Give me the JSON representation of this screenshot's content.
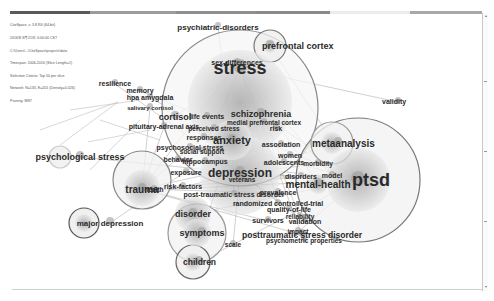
{
  "header": {
    "info_lines": [
      "CiteSpace, v. 3.8.R6 (64-bit)",
      "2016年3月21日 0:00:00 CST",
      "C:\\Users\\...\\CiteSpace\\projects\\data",
      "Timespan: 2006-2016 (Slice Length=1)",
      "Selection Criteria: Top 50 per slice",
      "Network: N=133, E=201 (Density=0.026)",
      "Pruning: MST"
    ],
    "timeline_colors": [
      "#5a5a5a",
      "#7a7a7a",
      "#9c9c9c",
      "#8e8e8e",
      "#8a8a8a",
      "#ececec",
      "#a8a8a8"
    ]
  },
  "network": {
    "title": "Keyword co-occurrence network",
    "nodes": [
      {
        "label": "stress",
        "size": "xl"
      },
      {
        "label": "ptsd",
        "size": "xl"
      },
      {
        "label": "depression",
        "size": "l"
      },
      {
        "label": "anxiety",
        "size": "m"
      },
      {
        "label": "trauma",
        "size": "m"
      },
      {
        "label": "mental-health",
        "size": "m"
      },
      {
        "label": "metaanalysis",
        "size": "m"
      },
      {
        "label": "prefrontal cortex",
        "size": "m"
      },
      {
        "label": "psychiatric-disorders",
        "size": "s"
      },
      {
        "label": "sex-differences",
        "size": "s"
      },
      {
        "label": "validity",
        "size": "s"
      },
      {
        "label": "resilience",
        "size": "s"
      },
      {
        "label": "memory",
        "size": "s"
      },
      {
        "label": "hpa amygdala",
        "size": "s"
      },
      {
        "label": "salivary cortisol",
        "size": "s"
      },
      {
        "label": "cortisol",
        "size": "m"
      },
      {
        "label": "life events",
        "size": "s"
      },
      {
        "label": "schizophrenia",
        "size": "m"
      },
      {
        "label": "medial prefrontal cortex",
        "size": "s"
      },
      {
        "label": "pituitary-adrenal axis",
        "size": "s"
      },
      {
        "label": "perceived stress",
        "size": "s"
      },
      {
        "label": "risk",
        "size": "s"
      },
      {
        "label": "responses",
        "size": "s"
      },
      {
        "label": "association",
        "size": "s"
      },
      {
        "label": "psychosocial stress",
        "size": "s"
      },
      {
        "label": "social support",
        "size": "s"
      },
      {
        "label": "psychological stress",
        "size": "m"
      },
      {
        "label": "behavior",
        "size": "s"
      },
      {
        "label": "hippocampus",
        "size": "s"
      },
      {
        "label": "women",
        "size": "s"
      },
      {
        "label": "adolescents",
        "size": "s"
      },
      {
        "label": "morbidity",
        "size": "s"
      },
      {
        "label": "exposure",
        "size": "s"
      },
      {
        "label": "veterans",
        "size": "s"
      },
      {
        "label": "disorders",
        "size": "s"
      },
      {
        "label": "model",
        "size": "s"
      },
      {
        "label": "risk-factors",
        "size": "s"
      },
      {
        "label": "health",
        "size": "s"
      },
      {
        "label": "post-traumatic stress disorder",
        "size": "s"
      },
      {
        "label": "prevalence",
        "size": "s"
      },
      {
        "label": "randomized controlled-trial",
        "size": "s"
      },
      {
        "label": "quality-of-life",
        "size": "s"
      },
      {
        "label": "disorder",
        "size": "m"
      },
      {
        "label": "major depression",
        "size": "m"
      },
      {
        "label": "survivors",
        "size": "s"
      },
      {
        "label": "reliability",
        "size": "s"
      },
      {
        "label": "validation",
        "size": "s"
      },
      {
        "label": "impact",
        "size": "s"
      },
      {
        "label": "symptoms",
        "size": "m"
      },
      {
        "label": "posttraumatic stress disorder",
        "size": "m"
      },
      {
        "label": "psychometric properties",
        "size": "s"
      },
      {
        "label": "scale",
        "size": "s"
      },
      {
        "label": "children",
        "size": "m"
      }
    ]
  }
}
